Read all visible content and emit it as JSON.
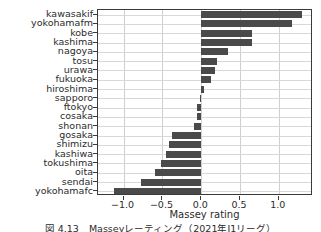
{
  "chart_data": {
    "type": "bar",
    "orientation": "horizontal",
    "title": "",
    "xlabel": "Massey rating",
    "ylabel": "",
    "xlim": [
      -1.33,
      1.44
    ],
    "ylim": [
      -0.6,
      19.6
    ],
    "grid": true,
    "legend": null,
    "bar_color": "#4a4a4a",
    "xticks": [
      -1.0,
      -0.5,
      0.0,
      0.5,
      1.0
    ],
    "xtick_labels": [
      "−1.0",
      "−0.5",
      "0.0",
      "0.5",
      "1.0"
    ],
    "categories": [
      "kawasakif",
      "yokohamafm",
      "kobe",
      "kashima",
      "nagoya",
      "tosu",
      "urawa",
      "fukuoka",
      "hiroshima",
      "sapporo",
      "ftokyo",
      "cosaka",
      "shonan",
      "gosaka",
      "shimizu",
      "kashiwa",
      "tokushima",
      "oita",
      "sendai",
      "yokohamafc"
    ],
    "values": [
      1.3,
      1.17,
      0.66,
      0.66,
      0.35,
      0.2,
      0.18,
      0.12,
      0.04,
      -0.02,
      -0.06,
      -0.06,
      -0.09,
      -0.38,
      -0.41,
      -0.46,
      -0.52,
      -0.6,
      -0.78,
      -1.13
    ]
  },
  "caption": {
    "text": "図 4.13　Masseyレーティング（2021年J1リーグ）"
  }
}
